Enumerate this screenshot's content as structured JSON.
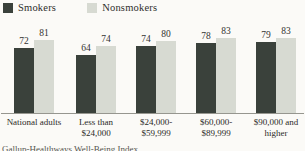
{
  "legend": {
    "smokers": {
      "label": "Smokers",
      "color": "#3a413b"
    },
    "nonsmokers": {
      "label": "Nonsmokers",
      "color": "#d7dad2"
    }
  },
  "chart_data": {
    "type": "bar",
    "categories": [
      "National adults",
      "Less than\n$24,000",
      "$24,000-\n$59,999",
      "$60,000-\n$89,999",
      "$90,000 and\nhigher"
    ],
    "series": [
      {
        "name": "Smokers",
        "color": "#3a413b",
        "values": [
          72,
          64,
          74,
          78,
          79
        ]
      },
      {
        "name": "Nonsmokers",
        "color": "#d7dad2",
        "values": [
          81,
          74,
          80,
          83,
          83
        ]
      }
    ],
    "title": "",
    "xlabel": "",
    "ylabel": "",
    "ylim": [
      0,
      100
    ],
    "value_labels_shown": true,
    "legend_position": "top-left",
    "grid": false
  },
  "footer": {
    "source": "Gallup-Healthways Well-Being Index"
  }
}
